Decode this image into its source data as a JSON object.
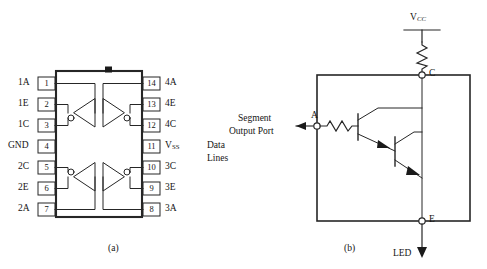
{
  "figure": {
    "panel_a": {
      "caption": "(a)",
      "component": "14-pin DIP integrated circuit with four inverter/driver stages",
      "notch": "orientation-notch",
      "left_pins": [
        {
          "num": "1",
          "label": "1A"
        },
        {
          "num": "2",
          "label": "1E"
        },
        {
          "num": "3",
          "label": "1C"
        },
        {
          "num": "4",
          "label": "GND"
        },
        {
          "num": "5",
          "label": "2C"
        },
        {
          "num": "6",
          "label": "2E"
        },
        {
          "num": "7",
          "label": "2A"
        }
      ],
      "right_pins": [
        {
          "num": "14",
          "label": "4A"
        },
        {
          "num": "13",
          "label": "4E"
        },
        {
          "num": "12",
          "label": "4C"
        },
        {
          "num": "11",
          "label": "V",
          "sub": "SS"
        },
        {
          "num": "10",
          "label": "3C"
        },
        {
          "num": "9",
          "label": "3E"
        },
        {
          "num": "8",
          "label": "3A"
        }
      ],
      "side_note": {
        "line1": "Data",
        "line2": "Lines"
      }
    },
    "panel_b": {
      "caption": "(b)",
      "component": "Darlington transistor pair LED driver",
      "supply_label": "V",
      "supply_sub": "CC",
      "terminal_c": "C",
      "terminal_e": "E",
      "terminal_a": "A",
      "input_label": {
        "line1": "Segment",
        "line2": "Output Port"
      },
      "output_label": "LED"
    }
  },
  "colors": {
    "ink": "#141414",
    "line": "#262626",
    "background": "#ffffff"
  }
}
